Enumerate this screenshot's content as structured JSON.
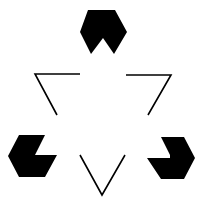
{
  "figure": {
    "name": "Kanizsa triangle illusion",
    "background": "#ffffff",
    "fill_color": "#000000",
    "stroke_color": "#000000",
    "stroke_width": 1.6,
    "pacmen": [
      {
        "id": "top",
        "points": "88,10 115,10 127,32 114,54 103,38 91,54 80,32"
      },
      {
        "id": "left",
        "points": "19,135 45,135 35,155 57,155 45,177 19,177 8,156"
      },
      {
        "id": "right",
        "points": "161,137 184,137 195,158 184,179 161,179 147,158 170,158 170,155"
      }
    ],
    "corners": [
      {
        "id": "top-left",
        "points": "80,74 35,74 57,115"
      },
      {
        "id": "top-right",
        "points": "126,75 171,75 148,115"
      },
      {
        "id": "bottom",
        "points": "80,155 102,195 125,155"
      }
    ]
  }
}
